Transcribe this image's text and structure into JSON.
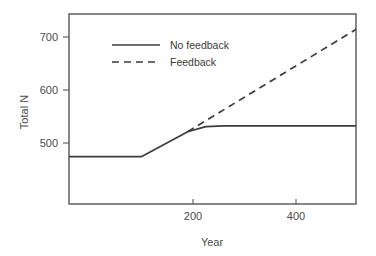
{
  "chart_data": {
    "type": "line",
    "title": "",
    "xlabel": "Year",
    "ylabel": "Total N",
    "xlim": [
      -40,
      516
    ],
    "ylim": [
      440,
      737
    ],
    "xticks": [
      200,
      400
    ],
    "xtick_labels": [
      "200",
      "400"
    ],
    "yticks": [
      500,
      600,
      700
    ],
    "ytick_labels": [
      "500",
      "600",
      "700"
    ],
    "grid": false,
    "legend_position": "upper-left-inside",
    "series": [
      {
        "name": "No feedback",
        "style": "solid",
        "color": "#3c3c3c",
        "x": [
          -40,
          100,
          190,
          225,
          260,
          516
        ],
        "y": [
          514,
          514,
          553,
          561,
          562,
          562
        ]
      },
      {
        "name": "Feedback",
        "style": "dashed",
        "color": "#3c3c3c",
        "x": [
          190,
          516
        ],
        "y": [
          553,
          713
        ]
      }
    ]
  },
  "axes": {
    "y_title": "Total N",
    "x_title": "Year"
  },
  "legend": {
    "entries": [
      {
        "label": "No feedback",
        "style": "solid"
      },
      {
        "label": "Feedback",
        "style": "dashed"
      }
    ]
  }
}
